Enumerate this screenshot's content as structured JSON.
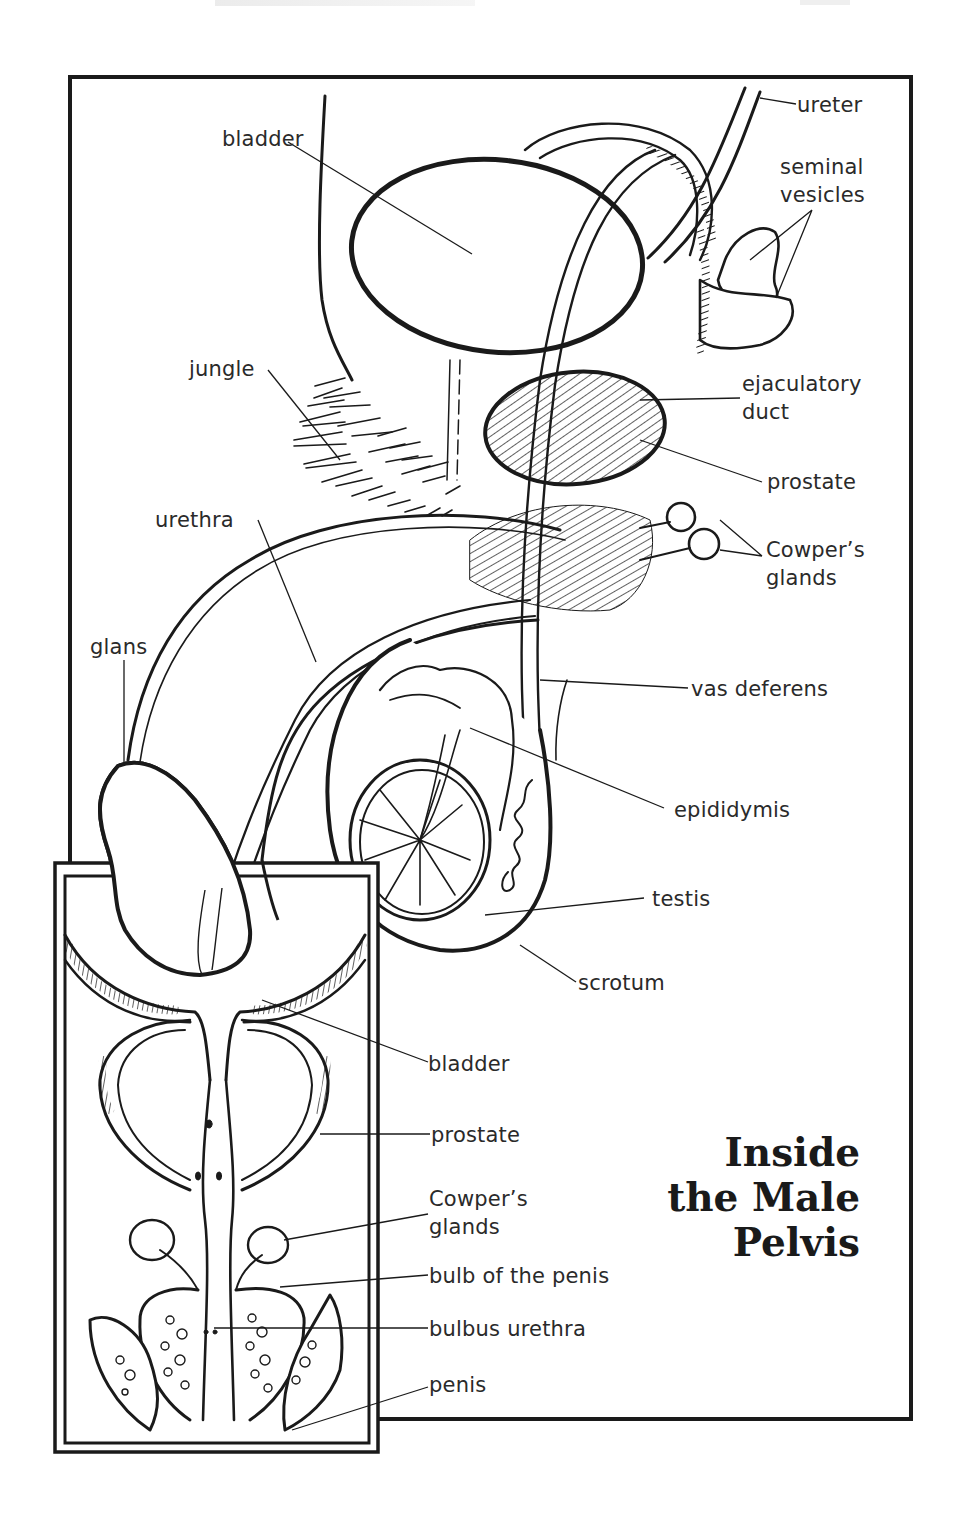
{
  "page": {
    "title_lines": [
      "Inside",
      "the Male",
      "Pelvis"
    ]
  },
  "main_diagram": {
    "labels": {
      "bladder": "bladder",
      "ureter": "ureter",
      "seminal_vesicles_line1": "seminal",
      "seminal_vesicles_line2": "vesicles",
      "jungle": "jungle",
      "ejaculatory_duct_line1": "ejaculatory",
      "ejaculatory_duct_line2": "duct",
      "prostate": "prostate",
      "urethra": "urethra",
      "cowpers_glands_line1": "Cowper’s",
      "cowpers_glands_line2": "glands",
      "glans": "glans",
      "vas_deferens": "vas deferens",
      "epididymis": "epididymis",
      "testis": "testis",
      "scrotum": "scrotum"
    }
  },
  "inset_diagram": {
    "labels": {
      "bladder": "bladder",
      "prostate": "prostate",
      "cowpers_glands_line1": "Cowper’s",
      "cowpers_glands_line2": "glands",
      "bulb_of_the_penis": "bulb of the penis",
      "bulbus_urethra": "bulbus urethra",
      "penis": "penis"
    }
  },
  "colors": {
    "ink": "#1a1a1a",
    "label_text": "#2a2a2a",
    "background": "#ffffff"
  }
}
